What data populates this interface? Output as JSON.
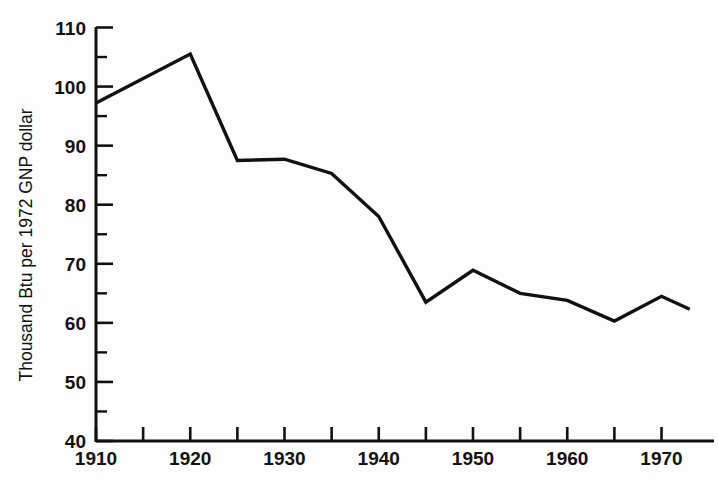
{
  "chart_data": {
    "type": "line",
    "title": "",
    "subtitle": "",
    "xlabel": "",
    "ylabel": "Thousand Btu per 1972 GNP dollar",
    "xlim": [
      1910,
      1974
    ],
    "ylim": [
      40,
      110
    ],
    "grid": false,
    "legend": "none",
    "x_major_ticks": [
      1910,
      1920,
      1930,
      1940,
      1950,
      1960,
      1970
    ],
    "x_major_tick_labels": [
      "1910",
      "1920",
      "1930",
      "1940",
      "1950",
      "1960",
      "1970"
    ],
    "x_minor_ticks": [
      1915,
      1925,
      1935,
      1945,
      1955,
      1965
    ],
    "y_major_ticks": [
      40,
      50,
      60,
      70,
      80,
      90,
      100,
      110
    ],
    "y_major_tick_labels": [
      "40",
      "50",
      "60",
      "70",
      "80",
      "90",
      "100",
      "110"
    ],
    "y_minor_ticks": [
      45,
      55,
      65,
      75,
      85,
      95,
      105
    ],
    "line_color": "#111111",
    "line_width": 3.4,
    "series": [
      {
        "name": "Energy intensity",
        "x": [
          1910,
          1920,
          1925,
          1930,
          1935,
          1940,
          1945,
          1950,
          1955,
          1960,
          1965,
          1970,
          1973
        ],
        "values": [
          97.2,
          105.5,
          87.5,
          87.7,
          85.3,
          78.0,
          63.5,
          68.9,
          65.0,
          63.8,
          60.3,
          64.5,
          62.3
        ]
      }
    ]
  },
  "axes": {
    "y_title": "Thousand Btu per 1972 GNP dollar"
  }
}
